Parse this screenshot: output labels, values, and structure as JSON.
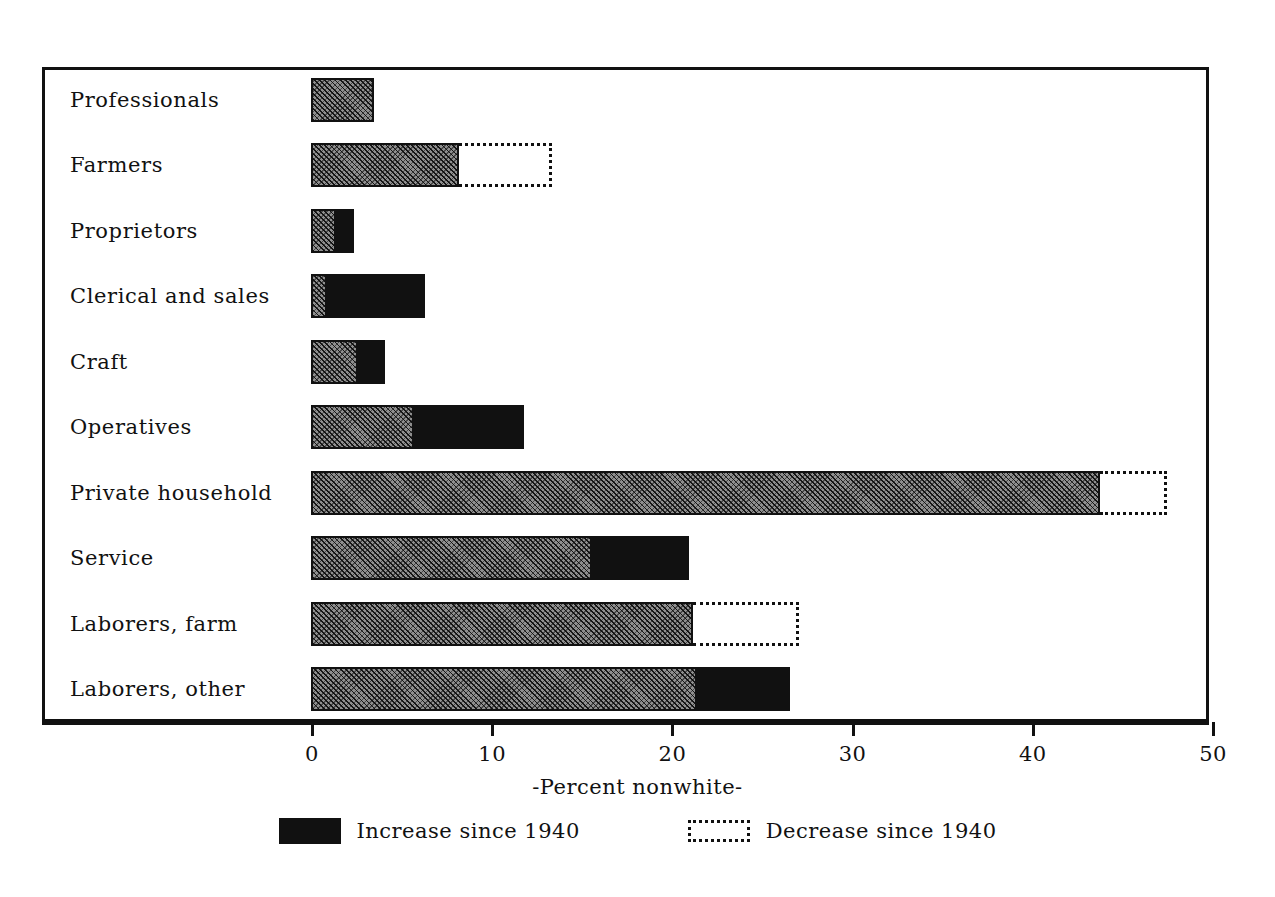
{
  "chart_data": {
    "type": "bar",
    "orientation": "horizontal",
    "stacked": true,
    "title": "",
    "xlabel": "-Percent nonwhite-",
    "ylabel": "",
    "xlim": [
      0,
      50
    ],
    "xticks": [
      0,
      10,
      20,
      30,
      40,
      50
    ],
    "xtick_labels": [
      "0",
      "10",
      "20",
      "30",
      "40",
      "50"
    ],
    "grid": false,
    "legend_position": "bottom",
    "categories": [
      "Professionals",
      "Farmers",
      "Proprietors",
      "Clerical and sales",
      "Craft",
      "Operatives",
      "Private household",
      "Service",
      "Laborers, farm",
      "Laborers, other"
    ],
    "series": [
      {
        "name": "Base (1940 level)",
        "style": "hatched",
        "values": [
          3.5,
          8.2,
          1.4,
          0.9,
          2.6,
          5.7,
          43.8,
          15.6,
          21.2,
          21.4
        ]
      },
      {
        "name": "Increase since 1940",
        "style": "solid-black",
        "values": [
          0.0,
          0.0,
          1.0,
          5.4,
          1.5,
          6.1,
          0.0,
          5.4,
          0.0,
          5.2
        ]
      },
      {
        "name": "Decrease since 1940",
        "style": "dotted-outline",
        "values": [
          0.0,
          5.2,
          0.0,
          0.0,
          0.0,
          0.0,
          3.7,
          0.0,
          5.9,
          0.0
        ]
      }
    ],
    "totals_1950": [
      3.5,
      8.2,
      2.4,
      6.3,
      4.1,
      11.8,
      43.8,
      21.0,
      21.2,
      26.6
    ],
    "totals_1940": [
      3.5,
      13.4,
      1.4,
      0.9,
      2.6,
      5.7,
      47.5,
      15.6,
      27.1,
      21.4
    ],
    "legend": [
      {
        "label": "Increase since 1940",
        "swatch": "solid-black"
      },
      {
        "label": "Decrease since 1940",
        "swatch": "dotted-outline"
      }
    ],
    "colors": {
      "axis": "#111111",
      "base_fill": "#8f8f8f",
      "increase_fill": "#111111",
      "decrease_outline": "#111111",
      "background": "#ffffff"
    }
  }
}
